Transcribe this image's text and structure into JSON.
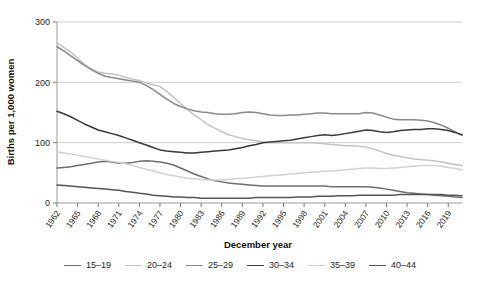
{
  "chart_data": {
    "type": "line",
    "title": "",
    "xlabel": "December year",
    "ylabel": "Births per 1,000 women",
    "ylim": [
      0,
      300
    ],
    "yticks": [
      0,
      100,
      200,
      300
    ],
    "xlim": [
      1962,
      2021
    ],
    "xticks": [
      1962,
      1965,
      1968,
      1971,
      1974,
      1977,
      1980,
      1983,
      1986,
      1989,
      1992,
      1995,
      1998,
      2001,
      2004,
      2007,
      2010,
      2013,
      2016,
      2019
    ],
    "grid": "horizontal",
    "legend_position": "bottom",
    "x": [
      1962,
      1963,
      1964,
      1965,
      1966,
      1967,
      1968,
      1969,
      1970,
      1971,
      1972,
      1973,
      1974,
      1975,
      1976,
      1977,
      1978,
      1979,
      1980,
      1981,
      1982,
      1983,
      1984,
      1985,
      1986,
      1987,
      1988,
      1989,
      1990,
      1991,
      1992,
      1993,
      1994,
      1995,
      1996,
      1997,
      1998,
      1999,
      2000,
      2001,
      2002,
      2003,
      2004,
      2005,
      2006,
      2007,
      2008,
      2009,
      2010,
      2011,
      2012,
      2013,
      2014,
      2015,
      2016,
      2017,
      2018,
      2019,
      2020,
      2021
    ],
    "series": [
      {
        "name": "15-19",
        "color": "#6e6e6e",
        "values": [
          58,
          59,
          60,
          62,
          64,
          66,
          68,
          69,
          68,
          66,
          66,
          67,
          69,
          70,
          69,
          68,
          66,
          63,
          58,
          53,
          48,
          44,
          40,
          37,
          35,
          33,
          32,
          31,
          30,
          29,
          28,
          28,
          28,
          28,
          28,
          28,
          28,
          28,
          28,
          28,
          27,
          27,
          27,
          27,
          27,
          27,
          26,
          25,
          23,
          21,
          19,
          17,
          16,
          15,
          14,
          13,
          12,
          11,
          10,
          9
        ]
      },
      {
        "name": "20-24",
        "color": "#c4c4c4",
        "values": [
          265,
          258,
          250,
          240,
          230,
          222,
          217,
          215,
          214,
          212,
          208,
          205,
          203,
          199,
          196,
          193,
          185,
          175,
          165,
          155,
          146,
          138,
          130,
          124,
          118,
          113,
          110,
          107,
          105,
          103,
          101,
          100,
          100,
          100,
          100,
          100,
          100,
          100,
          99,
          98,
          97,
          96,
          95,
          95,
          94,
          93,
          90,
          86,
          82,
          79,
          77,
          75,
          73,
          72,
          71,
          70,
          68,
          66,
          64,
          62
        ]
      },
      {
        "name": "25-29",
        "color": "#8a8a8a",
        "values": [
          259,
          252,
          244,
          236,
          228,
          221,
          215,
          210,
          208,
          206,
          204,
          202,
          200,
          195,
          188,
          180,
          172,
          165,
          160,
          156,
          153,
          151,
          150,
          148,
          147,
          147,
          148,
          150,
          151,
          150,
          148,
          146,
          145,
          145,
          146,
          146,
          147,
          148,
          149,
          149,
          148,
          148,
          148,
          148,
          148,
          150,
          149,
          146,
          142,
          139,
          138,
          138,
          138,
          137,
          136,
          133,
          129,
          124,
          118,
          112
        ]
      },
      {
        "name": "30-34",
        "color": "#3a3a3a",
        "values": [
          152,
          148,
          143,
          137,
          131,
          126,
          121,
          118,
          115,
          112,
          108,
          104,
          100,
          96,
          92,
          88,
          86,
          85,
          84,
          83,
          83,
          84,
          85,
          86,
          87,
          88,
          90,
          92,
          95,
          97,
          100,
          101,
          102,
          103,
          104,
          106,
          108,
          110,
          112,
          113,
          112,
          113,
          115,
          117,
          119,
          121,
          120,
          118,
          117,
          118,
          120,
          121,
          122,
          122,
          123,
          123,
          122,
          120,
          117,
          113
        ]
      },
      {
        "name": "35-39",
        "color": "#d2d2d2",
        "values": [
          85,
          83,
          81,
          79,
          77,
          75,
          73,
          71,
          69,
          67,
          65,
          62,
          59,
          56,
          53,
          50,
          47,
          45,
          43,
          41,
          40,
          39,
          38,
          38,
          38,
          39,
          40,
          41,
          42,
          43,
          44,
          45,
          46,
          47,
          48,
          49,
          50,
          51,
          52,
          53,
          53,
          54,
          55,
          56,
          57,
          58,
          58,
          57,
          57,
          58,
          59,
          60,
          61,
          62,
          62,
          62,
          61,
          59,
          57,
          55
        ]
      },
      {
        "name": "40-44",
        "color": "#555555",
        "values": [
          30,
          29,
          28,
          27,
          26,
          25,
          24,
          23,
          22,
          21,
          19,
          18,
          16,
          15,
          13,
          12,
          11,
          10,
          10,
          9,
          9,
          8,
          8,
          8,
          8,
          8,
          8,
          8,
          8,
          9,
          9,
          9,
          9,
          9,
          9,
          10,
          10,
          10,
          11,
          11,
          11,
          12,
          12,
          12,
          13,
          13,
          13,
          13,
          13,
          13,
          14,
          14,
          14,
          14,
          14,
          14,
          14,
          13,
          13,
          12
        ]
      }
    ]
  },
  "axis": {
    "y_title": "Births per 1,000 women",
    "x_title": "December year",
    "y_tick_labels": [
      "0",
      "100",
      "200",
      "300"
    ],
    "x_tick_labels": [
      "1962",
      "1965",
      "1968",
      "1971",
      "1974",
      "1977",
      "1980",
      "1983",
      "1986",
      "1989",
      "1992",
      "1995",
      "1998",
      "2001",
      "2004",
      "2007",
      "2010",
      "2013",
      "2016",
      "2019"
    ]
  },
  "legend": {
    "items": [
      {
        "label": "15–19",
        "color": "#6e6e6e"
      },
      {
        "label": "20–24",
        "color": "#c4c4c4"
      },
      {
        "label": "25–29",
        "color": "#8a8a8a"
      },
      {
        "label": "30–34",
        "color": "#3a3a3a"
      },
      {
        "label": "35–39",
        "color": "#d2d2d2"
      },
      {
        "label": "40–44",
        "color": "#555555"
      }
    ]
  }
}
